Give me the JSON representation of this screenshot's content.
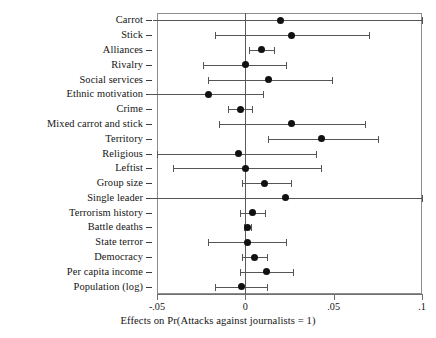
{
  "chart_data": {
    "type": "scatter",
    "subtype": "coefficient-plot-with-confidence-intervals",
    "title": "",
    "xlabel": "Effects on Pr(Attacks against journalists = 1)",
    "ylabel": "",
    "xlim": [
      -0.05,
      0.1
    ],
    "xticks": [
      -0.05,
      0,
      0.05,
      0.1
    ],
    "xticklabels": [
      "-.05",
      "0",
      ".05",
      ".1"
    ],
    "grid": false,
    "legend": null,
    "zero_reference_line": 0,
    "categories": [
      "Carrot",
      "Stick",
      "Alliances",
      "Rivalry",
      "Social services",
      "Ethnic motivation",
      "Crime",
      "Mixed carrot and stick",
      "Territory",
      "Religious",
      "Leftist",
      "Group size",
      "Single leader",
      "Terrorism history",
      "Battle deaths",
      "State terror",
      "Democracy",
      "Per capita income",
      "Population (log)"
    ],
    "points": [
      {
        "label": "Carrot",
        "estimate": 0.02,
        "ci_low": -0.052,
        "ci_high": 0.1
      },
      {
        "label": "Stick",
        "estimate": 0.026,
        "ci_low": -0.017,
        "ci_high": 0.07
      },
      {
        "label": "Alliances",
        "estimate": 0.009,
        "ci_low": 0.002,
        "ci_high": 0.016
      },
      {
        "label": "Rivalry",
        "estimate": 0.0,
        "ci_low": -0.024,
        "ci_high": 0.023
      },
      {
        "label": "Social services",
        "estimate": 0.013,
        "ci_low": -0.021,
        "ci_high": 0.049
      },
      {
        "label": "Ethnic motivation",
        "estimate": -0.021,
        "ci_low": -0.055,
        "ci_high": 0.01
      },
      {
        "label": "Crime",
        "estimate": -0.003,
        "ci_low": -0.01,
        "ci_high": 0.004
      },
      {
        "label": "Mixed carrot and stick",
        "estimate": 0.026,
        "ci_low": -0.015,
        "ci_high": 0.068
      },
      {
        "label": "Territory",
        "estimate": 0.043,
        "ci_low": 0.013,
        "ci_high": 0.075
      },
      {
        "label": "Religious",
        "estimate": -0.004,
        "ci_low": -0.05,
        "ci_high": 0.04
      },
      {
        "label": "Leftist",
        "estimate": 0.0,
        "ci_low": -0.041,
        "ci_high": 0.043
      },
      {
        "label": "Group size",
        "estimate": 0.011,
        "ci_low": -0.002,
        "ci_high": 0.026
      },
      {
        "label": "Single leader",
        "estimate": 0.023,
        "ci_low": -0.054,
        "ci_high": 0.1
      },
      {
        "label": "Terrorism history",
        "estimate": 0.004,
        "ci_low": -0.003,
        "ci_high": 0.011
      },
      {
        "label": "Battle deaths",
        "estimate": 0.001,
        "ci_low": -0.001,
        "ci_high": 0.003
      },
      {
        "label": "State terror",
        "estimate": 0.001,
        "ci_low": -0.021,
        "ci_high": 0.023
      },
      {
        "label": "Democracy",
        "estimate": 0.005,
        "ci_low": -0.002,
        "ci_high": 0.012
      },
      {
        "label": "Per capita income",
        "estimate": 0.012,
        "ci_low": -0.003,
        "ci_high": 0.027
      },
      {
        "label": "Population (log)",
        "estimate": -0.002,
        "ci_low": -0.017,
        "ci_high": 0.012
      }
    ],
    "colors": {
      "point": "#111111",
      "interval": "#555555",
      "axis": "#6e6e6e",
      "zero_line": "#5a5a5a",
      "panel_border": "#8d8d8d",
      "text": "#141414",
      "background": "#ffffff"
    }
  }
}
